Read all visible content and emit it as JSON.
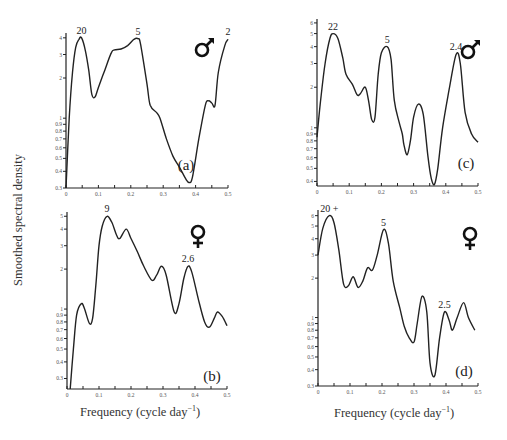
{
  "figure": {
    "ylabel": "Smoothed spectral density",
    "xlabel": "Frequency  (cycle day",
    "xlabel_sup": "−1",
    "xlabel_close": ")"
  },
  "chart_data": [
    {
      "panel": "(a)",
      "sex": "male",
      "sex_symbol": "♂",
      "type": "line",
      "xlabel": "Frequency (cycle day^-1)",
      "ylabel": "Smoothed spectral density",
      "yscale": "log",
      "xlim": [
        0,
        0.5
      ],
      "ylim": [
        0.3,
        4.2
      ],
      "xticks": [
        "0",
        "0.1",
        "0.2",
        "0.3",
        "0.4",
        "0.5"
      ],
      "yticks": [
        "0.3",
        "0.4",
        "0.5",
        "0.6",
        "0.7",
        "0.8",
        "0.9",
        "1",
        "2",
        "3",
        "4"
      ],
      "peak_annotations": [
        {
          "x": 0.048,
          "y": 4.0,
          "label": "20"
        },
        {
          "x": 0.222,
          "y": 3.9,
          "label": "5"
        },
        {
          "x": 0.5,
          "y": 3.9,
          "label": "2"
        }
      ],
      "x": [
        0,
        0.01,
        0.02,
        0.03,
        0.04,
        0.048,
        0.06,
        0.07,
        0.08,
        0.09,
        0.1,
        0.12,
        0.14,
        0.15,
        0.17,
        0.19,
        0.21,
        0.222,
        0.23,
        0.25,
        0.26,
        0.28,
        0.29,
        0.31,
        0.33,
        0.35,
        0.37,
        0.38,
        0.39,
        0.41,
        0.43,
        0.44,
        0.45,
        0.46,
        0.47,
        0.49,
        0.5
      ],
      "values": [
        0.3,
        1.0,
        2.2,
        3.4,
        3.9,
        4.0,
        3.2,
        2.3,
        1.5,
        1.45,
        1.7,
        2.3,
        3.1,
        3.25,
        3.3,
        3.5,
        3.9,
        3.95,
        3.6,
        1.8,
        1.25,
        1.1,
        1.0,
        0.7,
        0.52,
        0.43,
        0.35,
        0.33,
        0.36,
        0.7,
        1.25,
        1.35,
        1.3,
        1.25,
        2.2,
        3.5,
        3.9
      ]
    },
    {
      "panel": "(b)",
      "sex": "female",
      "sex_symbol": "♀",
      "type": "line",
      "xlabel": "Frequency (cycle day^-1)",
      "ylabel": "Smoothed spectral density",
      "yscale": "log",
      "xlim": [
        0,
        0.5
      ],
      "ylim": [
        0.25,
        5.2
      ],
      "xticks": [
        "0",
        "0.1",
        "0.2",
        "0.3",
        "0.4",
        "0.5"
      ],
      "yticks": [
        "0.3",
        "0.4",
        "0.5",
        "0.6",
        "0.7",
        "0.8",
        "0.9",
        "1",
        "2",
        "3",
        "4",
        "5"
      ],
      "peak_annotations": [
        {
          "x": 0.125,
          "y": 5.0,
          "label": "9"
        },
        {
          "x": 0.378,
          "y": 2.1,
          "label": "2.6"
        }
      ],
      "x": [
        0.01,
        0.02,
        0.03,
        0.045,
        0.055,
        0.07,
        0.08,
        0.09,
        0.1,
        0.11,
        0.125,
        0.14,
        0.155,
        0.165,
        0.185,
        0.2,
        0.22,
        0.24,
        0.265,
        0.28,
        0.295,
        0.31,
        0.335,
        0.35,
        0.365,
        0.378,
        0.39,
        0.41,
        0.43,
        0.445,
        0.46,
        0.47,
        0.485,
        0.5
      ],
      "values": [
        0.25,
        0.5,
        0.9,
        1.1,
        1.0,
        0.78,
        0.85,
        1.5,
        3.0,
        4.2,
        5.0,
        4.5,
        3.6,
        3.4,
        4.0,
        3.4,
        2.7,
        2.1,
        1.65,
        1.8,
        2.1,
        1.8,
        0.95,
        1.1,
        1.7,
        2.1,
        1.9,
        1.2,
        0.8,
        0.73,
        0.85,
        0.95,
        0.88,
        0.75
      ]
    },
    {
      "panel": "(c)",
      "sex": "male",
      "sex_symbol": "♂",
      "type": "line",
      "xlabel": "Frequency (cycle day^-1)",
      "ylabel": "Smoothed spectral density",
      "yscale": "log",
      "xlim": [
        0,
        0.5
      ],
      "ylim": [
        0.37,
        6.2
      ],
      "xticks": [
        "0",
        "0.1",
        "0.2",
        "0.3",
        "0.4",
        "0.5"
      ],
      "yticks": [
        "0.4",
        "0.5",
        "0.6",
        "0.7",
        "0.8",
        "0.9",
        "1",
        "2",
        "3",
        "4",
        "5",
        "6"
      ],
      "peak_annotations": [
        {
          "x": 0.05,
          "y": 5.0,
          "label": "22"
        },
        {
          "x": 0.218,
          "y": 4.0,
          "label": "5"
        },
        {
          "x": 0.432,
          "y": 3.5,
          "label": "2.4"
        }
      ],
      "x": [
        0,
        0.01,
        0.025,
        0.04,
        0.05,
        0.065,
        0.08,
        0.09,
        0.11,
        0.125,
        0.135,
        0.15,
        0.16,
        0.17,
        0.18,
        0.19,
        0.2,
        0.218,
        0.23,
        0.24,
        0.255,
        0.265,
        0.27,
        0.28,
        0.29,
        0.3,
        0.315,
        0.33,
        0.345,
        0.355,
        0.365,
        0.375,
        0.39,
        0.41,
        0.432,
        0.445,
        0.46,
        0.48,
        0.5
      ],
      "values": [
        0.85,
        1.5,
        3.0,
        4.6,
        5.0,
        4.6,
        3.3,
        2.5,
        2.1,
        1.75,
        1.8,
        2.0,
        1.6,
        1.15,
        1.2,
        2.5,
        3.6,
        4.0,
        3.2,
        1.6,
        1.1,
        0.9,
        0.75,
        0.63,
        0.8,
        1.2,
        1.5,
        1.25,
        0.6,
        0.42,
        0.38,
        0.5,
        1.0,
        1.9,
        3.5,
        3.0,
        1.3,
        0.9,
        0.78
      ]
    },
    {
      "panel": "(d)",
      "sex": "female",
      "sex_symbol": "♀",
      "type": "line",
      "xlabel": "Frequency (cycle day^-1)",
      "ylabel": "Smoothed spectral density",
      "yscale": "log",
      "xlim": [
        0,
        0.5
      ],
      "ylim": [
        0.3,
        6.4
      ],
      "xticks": [
        "0",
        "0.1",
        "0.2",
        "0.3",
        "0.4",
        "0.5"
      ],
      "yticks": [
        "0.3",
        "0.4",
        "0.5",
        "0.6",
        "0.7",
        "0.8",
        "0.9",
        "1",
        "2",
        "3",
        "4",
        "5",
        "6"
      ],
      "peak_annotations": [
        {
          "x": 0.035,
          "y": 6.0,
          "label": "20 +"
        },
        {
          "x": 0.205,
          "y": 4.7,
          "label": "5"
        },
        {
          "x": 0.395,
          "y": 1.1,
          "label": "2.5"
        }
      ],
      "x": [
        0,
        0.015,
        0.035,
        0.05,
        0.065,
        0.08,
        0.095,
        0.11,
        0.125,
        0.14,
        0.155,
        0.17,
        0.185,
        0.205,
        0.22,
        0.235,
        0.255,
        0.27,
        0.285,
        0.3,
        0.31,
        0.325,
        0.34,
        0.35,
        0.365,
        0.38,
        0.395,
        0.41,
        0.42,
        0.435,
        0.455,
        0.47,
        0.49
      ],
      "values": [
        3.0,
        4.8,
        6.0,
        5.3,
        3.3,
        1.8,
        1.75,
        2.05,
        1.7,
        1.9,
        2.4,
        2.3,
        3.0,
        4.7,
        3.7,
        1.9,
        1.2,
        0.85,
        0.7,
        0.65,
        0.9,
        1.45,
        1.1,
        0.45,
        0.36,
        0.7,
        1.1,
        0.95,
        0.8,
        1.0,
        1.3,
        1.0,
        0.8
      ]
    }
  ]
}
